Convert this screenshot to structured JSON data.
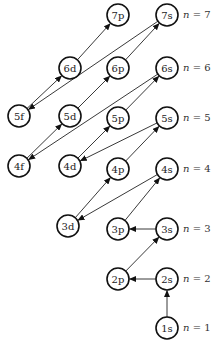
{
  "diagram": {
    "title": "",
    "type": "aufbau-orbital-filling-order",
    "node_radius": 11,
    "nodes": [
      {
        "id": "1s",
        "label": "1s",
        "x": 167,
        "y": 328
      },
      {
        "id": "2s",
        "label": "2s",
        "x": 167,
        "y": 279
      },
      {
        "id": "2p",
        "label": "2p",
        "x": 118,
        "y": 279
      },
      {
        "id": "3s",
        "label": "3s",
        "x": 167,
        "y": 229
      },
      {
        "id": "3p",
        "label": "3p",
        "x": 118,
        "y": 229
      },
      {
        "id": "3d",
        "label": "3d",
        "x": 68,
        "y": 226
      },
      {
        "id": "4s",
        "label": "4s",
        "x": 167,
        "y": 169
      },
      {
        "id": "4p",
        "label": "4p",
        "x": 118,
        "y": 169
      },
      {
        "id": "4d",
        "label": "4d",
        "x": 70,
        "y": 166
      },
      {
        "id": "4f",
        "label": "4f",
        "x": 19,
        "y": 166
      },
      {
        "id": "5s",
        "label": "5s",
        "x": 167,
        "y": 118
      },
      {
        "id": "5p",
        "label": "5p",
        "x": 118,
        "y": 118
      },
      {
        "id": "5d",
        "label": "5d",
        "x": 70,
        "y": 116
      },
      {
        "id": "5f",
        "label": "5f",
        "x": 19,
        "y": 116
      },
      {
        "id": "6s",
        "label": "6s",
        "x": 167,
        "y": 68
      },
      {
        "id": "6p",
        "label": "6p",
        "x": 118,
        "y": 68
      },
      {
        "id": "6d",
        "label": "6d",
        "x": 70,
        "y": 68
      },
      {
        "id": "7s",
        "label": "7s",
        "x": 167,
        "y": 15
      },
      {
        "id": "7p",
        "label": "7p",
        "x": 118,
        "y": 15
      }
    ],
    "edges": [
      {
        "from": "1s",
        "to": "2s"
      },
      {
        "from": "2s",
        "to": "2p"
      },
      {
        "from": "2p",
        "to": "3s"
      },
      {
        "from": "3s",
        "to": "3p"
      },
      {
        "from": "3p",
        "to": "4s"
      },
      {
        "from": "4s",
        "to": "3d"
      },
      {
        "from": "3d",
        "to": "4p"
      },
      {
        "from": "4p",
        "to": "5s"
      },
      {
        "from": "5s",
        "to": "4d"
      },
      {
        "from": "4d",
        "to": "5p"
      },
      {
        "from": "5p",
        "to": "6s"
      },
      {
        "from": "6s",
        "to": "4f"
      },
      {
        "from": "4f",
        "to": "5d"
      },
      {
        "from": "5d",
        "to": "6p"
      },
      {
        "from": "6p",
        "to": "7s"
      },
      {
        "from": "7s",
        "to": "5f"
      },
      {
        "from": "5f",
        "to": "6d"
      },
      {
        "from": "6d",
        "to": "7p"
      }
    ],
    "levels": [
      {
        "label": "n = 7",
        "x": 183,
        "y": 18
      },
      {
        "label": "n = 6",
        "x": 183,
        "y": 71
      },
      {
        "label": "n = 5",
        "x": 183,
        "y": 121
      },
      {
        "label": "n = 4",
        "x": 183,
        "y": 172
      },
      {
        "label": "n = 3",
        "x": 183,
        "y": 232
      },
      {
        "label": "n = 2",
        "x": 183,
        "y": 282
      },
      {
        "label": "n = 1",
        "x": 183,
        "y": 331
      }
    ],
    "colors": {
      "stroke": "#111111",
      "fill": "#ffffff",
      "text": "#222222"
    }
  }
}
